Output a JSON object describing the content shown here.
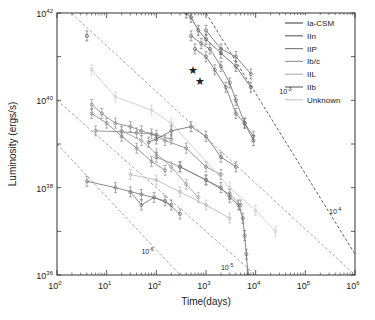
{
  "chart_data": {
    "type": "scatter",
    "title": "",
    "xlabel": "Time(days)",
    "ylabel": "Luminosity (ergs/s)",
    "xscale": "log",
    "yscale": "log",
    "xlim": [
      1,
      1000000
    ],
    "ylim": [
      1e+36,
      1e+42
    ],
    "x_ticks": [
      {
        "value": 1,
        "label_base": "10",
        "label_exp": "0"
      },
      {
        "value": 10,
        "label_base": "10",
        "label_exp": "1"
      },
      {
        "value": 100,
        "label_base": "10",
        "label_exp": "2"
      },
      {
        "value": 1000,
        "label_base": "10",
        "label_exp": "3"
      },
      {
        "value": 10000,
        "label_base": "10",
        "label_exp": "4"
      },
      {
        "value": 100000,
        "label_base": "10",
        "label_exp": "5"
      },
      {
        "value": 1000000,
        "label_base": "10",
        "label_exp": "6"
      }
    ],
    "y_ticks": [
      {
        "value": 1e+36,
        "label_base": "10",
        "label_exp": "36"
      },
      {
        "value": 1e+38,
        "label_base": "10",
        "label_exp": "38"
      },
      {
        "value": 1e+40,
        "label_base": "10",
        "label_exp": "40"
      },
      {
        "value": 1e+42,
        "label_base": "10",
        "label_exp": "42"
      }
    ],
    "grid": false,
    "legend_position": "upper right",
    "legend": [
      {
        "name": "Ia-CSM",
        "color": "#555555"
      },
      {
        "name": "IIn",
        "color": "#6a6a6a"
      },
      {
        "name": "IIP",
        "color": "#808080"
      },
      {
        "name": "Ib/c",
        "color": "#9a9a9a"
      },
      {
        "name": "IIL",
        "color": "#b4b4b4"
      },
      {
        "name": "IIb",
        "color": "#707070"
      },
      {
        "name": "Unknown",
        "color": "#c8c8c8"
      }
    ],
    "reference_lines": [
      {
        "label_base": "10",
        "label_exp": "-3",
        "points": [
          [
            1000,
            1e+42
          ],
          [
            1000000,
            3e+36
          ]
        ],
        "label_at": [
          30000,
          1.4e+40
        ]
      },
      {
        "label_base": "10",
        "label_exp": "-4",
        "points": [
          [
            1,
            2e+42
          ],
          [
            1000000,
            1e+36
          ]
        ],
        "label_at": [
          300000,
          2.5e+37
        ]
      },
      {
        "label_base": "10",
        "label_exp": "-5",
        "points": [
          [
            1,
            1e+40
          ],
          [
            10000,
            1e+36
          ]
        ],
        "label_at": [
          2000,
          1.3e+36
        ]
      },
      {
        "label_base": "10",
        "label_exp": "-6",
        "points": [
          [
            1,
            1e+39
          ],
          [
            300,
            1e+36
          ]
        ],
        "label_at": [
          50,
          3e+36
        ]
      }
    ],
    "annotations": [
      {
        "type": "star",
        "x": 550,
        "y": 5e+40
      },
      {
        "type": "star",
        "x": 750,
        "y": 2.8e+40
      }
    ],
    "series": [
      {
        "name": "Ia-CSM",
        "points": [
          [
            400,
            1e+42
          ],
          [
            500,
            8e+41
          ],
          [
            700,
            4e+41
          ],
          [
            1000,
            2.5e+41
          ],
          [
            2000,
            1.2e+41
          ],
          [
            4000,
            6e+40
          ],
          [
            8000,
            2e+40
          ]
        ]
      },
      {
        "name": "IIn",
        "points": [
          [
            500,
            3e+41
          ],
          [
            800,
            2e+41
          ],
          [
            1200,
            1.5e+41
          ],
          [
            2000,
            6e+40
          ],
          [
            3000,
            2.5e+40
          ],
          [
            4000,
            1e+40
          ],
          [
            6000,
            3e+39
          ],
          [
            9000,
            1.5e+39
          ]
        ]
      },
      {
        "name": "IIn",
        "points": [
          [
            600,
            1.5e+41
          ],
          [
            1000,
            1e+41
          ],
          [
            1500,
            5e+40
          ],
          [
            2500,
            2e+40
          ],
          [
            4000,
            5e+39
          ],
          [
            6000,
            3e+39
          ],
          [
            9000,
            1.2e+39
          ]
        ]
      },
      {
        "name": "IIn",
        "points": [
          [
            1000,
            4e+41
          ],
          [
            2000,
            1.5e+41
          ],
          [
            4000,
            1e+41
          ],
          [
            8000,
            4e+40
          ]
        ]
      },
      {
        "name": "IIP",
        "points": [
          [
            5,
            8e+39
          ],
          [
            8,
            5e+39
          ],
          [
            15,
            3e+39
          ],
          [
            30,
            2.5e+39
          ],
          [
            50,
            2e+39
          ],
          [
            100,
            1.6e+39
          ],
          [
            200,
            1.3e+39
          ]
        ]
      },
      {
        "name": "IIP",
        "points": [
          [
            5,
            5e+39
          ],
          [
            10,
            3e+39
          ],
          [
            20,
            1.5e+39
          ],
          [
            40,
            8e+38
          ],
          [
            80,
            4e+38
          ],
          [
            150,
            2.5e+38
          ]
        ]
      },
      {
        "name": "IIP",
        "points": [
          [
            6,
            2e+39
          ],
          [
            20,
            1.9e+39
          ],
          [
            40,
            1.8e+39
          ],
          [
            80,
            1.7e+39
          ],
          [
            150,
            1.2e+39
          ],
          [
            400,
            8e+38
          ],
          [
            1000,
            3e+38
          ],
          [
            2000,
            2e+38
          ]
        ]
      },
      {
        "name": "Ib/c",
        "points": [
          [
            20,
            2e+39
          ],
          [
            50,
            1.2e+39
          ],
          [
            100,
            6e+38
          ],
          [
            200,
            3e+38
          ],
          [
            400,
            1.2e+38
          ],
          [
            700,
            6e+37
          ]
        ]
      },
      {
        "name": "IIb",
        "points": [
          [
            4,
            1.4e+38
          ],
          [
            15,
            1e+38
          ],
          [
            50,
            7e+37
          ],
          [
            150,
            5e+37
          ],
          [
            300,
            2.5e+37
          ]
        ]
      },
      {
        "name": "IIb",
        "points": [
          [
            30,
            8e+37
          ],
          [
            50,
            4e+37
          ],
          [
            90,
            6e+37
          ],
          [
            200,
            4e+37
          ]
        ]
      },
      {
        "name": "IIn",
        "points": [
          [
            300,
            3e+38
          ],
          [
            1000,
            1.5e+38
          ],
          [
            2000,
            1e+38
          ],
          [
            3000,
            6e+37
          ],
          [
            4500,
            4e+37
          ],
          [
            5500,
            2e+37
          ],
          [
            6000,
            8e+36
          ],
          [
            6500,
            3e+36
          ],
          [
            7000,
            1e+36
          ]
        ]
      },
      {
        "name": "IIL",
        "points": [
          [
            30,
            2e+38
          ],
          [
            100,
            1.5e+38
          ],
          [
            300,
            8e+37
          ],
          [
            1000,
            4e+37
          ],
          [
            3000,
            2e+37
          ]
        ]
      },
      {
        "name": "Unknown",
        "points": [
          [
            5,
            5e+40
          ],
          [
            15,
            1.2e+40
          ],
          [
            80,
            6e+39
          ],
          [
            200,
            3e+39
          ],
          [
            3000,
            1e+38
          ],
          [
            10000,
            3e+37
          ],
          [
            25000,
            1e+37
          ]
        ]
      },
      {
        "name": "IIn",
        "points": [
          [
            70,
            1.1e+39
          ],
          [
            100,
            1.3e+39
          ],
          [
            200,
            2e+39
          ],
          [
            500,
            2.5e+39
          ],
          [
            1000,
            1.5e+39
          ],
          [
            2000,
            5e+38
          ],
          [
            4000,
            3e+38
          ]
        ]
      },
      {
        "name": "IIP",
        "points": [
          [
            100,
            5e+38
          ],
          [
            300,
            3e+38
          ],
          [
            1000,
            1.5e+38
          ],
          [
            3000,
            7e+37
          ],
          [
            5000,
            4e+37
          ]
        ]
      },
      {
        "name": "Ia-CSM",
        "points": [
          [
            4,
            3e+41
          ]
        ]
      }
    ]
  }
}
